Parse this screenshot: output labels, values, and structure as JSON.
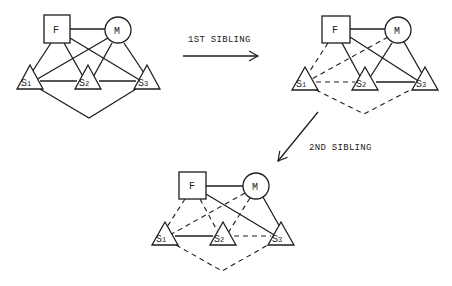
{
  "diagrams": [
    {
      "id": "initial",
      "nodes": {
        "F": "F",
        "M": "M",
        "S1": "S",
        "S2": "S",
        "S3": "S"
      },
      "subs": {
        "S1": "1",
        "S2": "2",
        "S3": "3"
      },
      "edges_solid": [
        "F-M",
        "F-S1",
        "F-S2",
        "F-S3",
        "M-S1",
        "M-S2",
        "M-S3",
        "S1-S2",
        "S2-S3",
        "S1-S3"
      ],
      "edges_dashed": []
    },
    {
      "id": "after-1st-sibling",
      "nodes": {
        "F": "F",
        "M": "M",
        "S1": "S",
        "S2": "S",
        "S3": "S"
      },
      "subs": {
        "S1": "1",
        "S2": "2",
        "S3": "3"
      },
      "edges_solid": [
        "F-M",
        "F-S2",
        "F-S3",
        "M-S2",
        "M-S3",
        "S2-S3"
      ],
      "edges_dashed": [
        "F-S1",
        "M-S1",
        "S1-S2",
        "S1-S3"
      ]
    },
    {
      "id": "after-2nd-sibling",
      "nodes": {
        "F": "F",
        "M": "M",
        "S1": "S",
        "S2": "S",
        "S3": "S"
      },
      "subs": {
        "S1": "1",
        "S2": "2",
        "S3": "3"
      },
      "edges_solid": [
        "F-M",
        "F-S3",
        "M-S3",
        "S1-S2"
      ],
      "edges_dashed": [
        "F-S1",
        "F-S2",
        "M-S1",
        "M-S2",
        "S2-S3",
        "S1-S3"
      ]
    }
  ],
  "arrows": [
    {
      "label": "1ST SIBLING"
    },
    {
      "label": "2ND SIBLING"
    }
  ],
  "colors": {
    "ink": "#1e1e1e",
    "background": "#ffffff"
  }
}
